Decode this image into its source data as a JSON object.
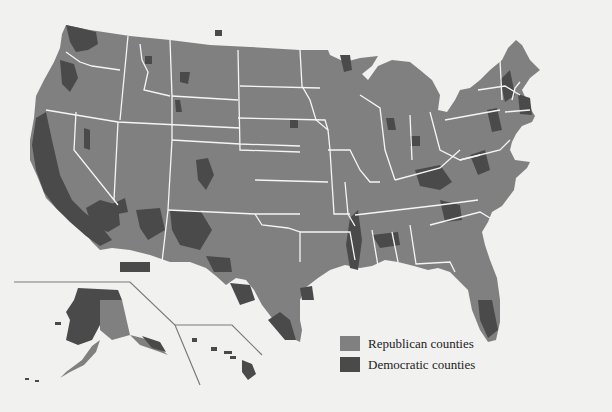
{
  "map": {
    "title": "",
    "regions": [
      "Contiguous United States",
      "Alaska inset",
      "Hawaii inset"
    ],
    "colors": {
      "background": "#f1f1f0",
      "republican": "#808080",
      "democratic": "#4a4a4a",
      "border": "#f5f5f5",
      "inset_frame": "#7a7a7a"
    }
  },
  "legend": {
    "items": [
      {
        "label": "Republican counties",
        "color": "#808080"
      },
      {
        "label": "Democratic counties",
        "color": "#4a4a4a"
      }
    ]
  }
}
